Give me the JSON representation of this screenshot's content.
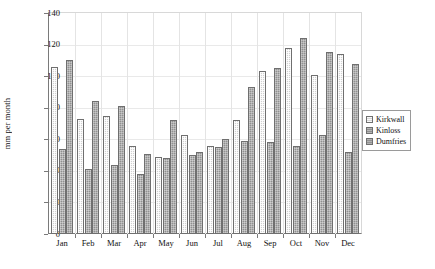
{
  "chart_data": {
    "type": "bar",
    "title": "",
    "xlabel": "",
    "ylabel": "mm per month",
    "ylim": [
      0,
      140
    ],
    "yticks": [
      0,
      20,
      40,
      60,
      80,
      100,
      120,
      140
    ],
    "grid": true,
    "legend_position": "right",
    "categories": [
      "Jan",
      "Feb",
      "Mar",
      "Apr",
      "May",
      "Jun",
      "Jul",
      "Aug",
      "Sep",
      "Oct",
      "Nov",
      "Dec"
    ],
    "series": [
      {
        "name": "Kirkwall",
        "values": [
          106,
          73,
          75,
          56,
          49,
          63,
          56,
          72,
          103,
          118,
          101,
          114
        ]
      },
      {
        "name": "Kinloss",
        "values": [
          54,
          41,
          44,
          38,
          48,
          50,
          55,
          59,
          58,
          56,
          63,
          52
        ]
      },
      {
        "name": "Dumfries",
        "values": [
          110,
          84,
          81,
          51,
          72,
          52,
          60,
          93,
          105,
          124,
          115,
          108
        ]
      }
    ]
  },
  "axis": {
    "y_title": "mm per month"
  },
  "legend": {
    "entries": [
      {
        "label": "Kirkwall",
        "swatch": "legend-swatch-kirkwall"
      },
      {
        "label": "Kinloss",
        "swatch": "legend-swatch-kinloss"
      },
      {
        "label": "Dumfries",
        "swatch": "legend-swatch-dumfries"
      }
    ]
  }
}
